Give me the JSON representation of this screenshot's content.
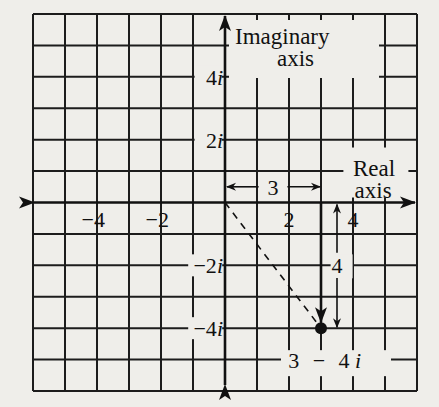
{
  "diagram": {
    "colors": {
      "background": "#efeeea",
      "ink": "#111111"
    },
    "grid": {
      "x_min": -6,
      "x_max": 6,
      "y_min": -6,
      "y_max": 6,
      "step": 1
    },
    "axes": {
      "real_label_line1": "Real",
      "real_label_line2": "axis",
      "imag_label_line1": "Imaginary",
      "imag_label_line2": "axis"
    },
    "real_ticks": [
      {
        "value": -4,
        "label": "−4"
      },
      {
        "value": -2,
        "label": "−2"
      },
      {
        "value": 2,
        "label": "2"
      },
      {
        "value": 4,
        "label": "4"
      }
    ],
    "imag_ticks": [
      {
        "value": 4,
        "label": "4",
        "suffix": "i"
      },
      {
        "value": 2,
        "label": "2",
        "suffix": "i"
      },
      {
        "value": -2,
        "label": "−2",
        "suffix": "i"
      },
      {
        "value": -4,
        "label": "−4",
        "suffix": "i"
      }
    ],
    "point": {
      "re": 3,
      "im": -4,
      "label_real": "3",
      "label_minus": "−",
      "label_imag": "4",
      "label_suffix": "i"
    },
    "dimensions": {
      "horizontal_label": "3",
      "vertical_label": "4"
    }
  },
  "chart_data": {
    "type": "scatter",
    "title": "",
    "xlabel": "Real axis",
    "ylabel": "Imaginary axis",
    "xlim": [
      -6,
      6
    ],
    "ylim": [
      -6,
      6
    ],
    "grid": true,
    "x_tick_labels": [
      "-4",
      "-2",
      "2",
      "4"
    ],
    "y_tick_labels": [
      "4i",
      "2i",
      "-2i",
      "-4i"
    ],
    "series": [
      {
        "name": "3 - 4i",
        "x": [
          3
        ],
        "y": [
          -4
        ]
      }
    ],
    "annotations": [
      {
        "text": "3",
        "type": "horizontal dimension",
        "from": [
          0,
          0.5
        ],
        "to": [
          3,
          0.5
        ]
      },
      {
        "text": "4",
        "type": "vertical dimension",
        "from": [
          3.5,
          0
        ],
        "to": [
          3.5,
          -4
        ]
      },
      {
        "text": "dashed line from origin to point",
        "from": [
          0,
          0
        ],
        "to": [
          3,
          -4
        ]
      },
      {
        "text": "arrow from real axis down to point",
        "from": [
          3,
          0
        ],
        "to": [
          3,
          -4
        ]
      },
      {
        "text": "3 - 4i",
        "at": [
          3,
          -5
        ]
      }
    ]
  }
}
